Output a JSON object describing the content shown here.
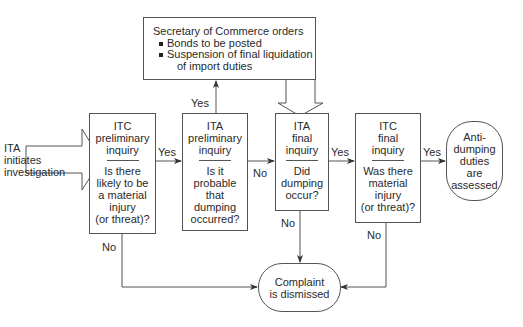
{
  "start": {
    "lines": [
      "ITA",
      "initiates",
      "investigation"
    ]
  },
  "secretary": {
    "title": "Secretary of Commerce orders",
    "bullets": [
      "Bonds to be posted",
      "Suspension of final liquidation"
    ],
    "continuation": "of import duties"
  },
  "steps": [
    {
      "head": [
        "ITC",
        "preliminary",
        "inquiry"
      ],
      "question": [
        "Is there",
        "likely to be",
        "a material",
        "injury",
        "(or threat)?"
      ]
    },
    {
      "head": [
        "ITA",
        "preliminary",
        "inquiry"
      ],
      "question": [
        "Is it",
        "probable",
        "that",
        "dumping",
        "occurred?"
      ]
    },
    {
      "head": [
        "ITA",
        "final",
        "inquiry"
      ],
      "question": [
        "Did",
        "dumping",
        "occur?"
      ]
    },
    {
      "head": [
        "ITC",
        "final",
        "inquiry"
      ],
      "question": [
        "Was there",
        "material",
        "injury",
        "(or threat)?"
      ]
    }
  ],
  "outcomes": {
    "assessed": [
      "Anti-",
      "dumping",
      "duties",
      "are",
      "assessed"
    ],
    "dismissed": [
      "Complaint",
      "is dismissed"
    ]
  },
  "edge_labels": {
    "step1_yes": "Yes",
    "step2_yes": "Yes",
    "step2_no": "No",
    "step3_yes": "Yes",
    "step4_yes": "Yes",
    "step1_no": "No",
    "step3_no": "No",
    "step4_no": "No"
  },
  "colors": {
    "line": "#555555",
    "text": "#2a2a2a"
  }
}
